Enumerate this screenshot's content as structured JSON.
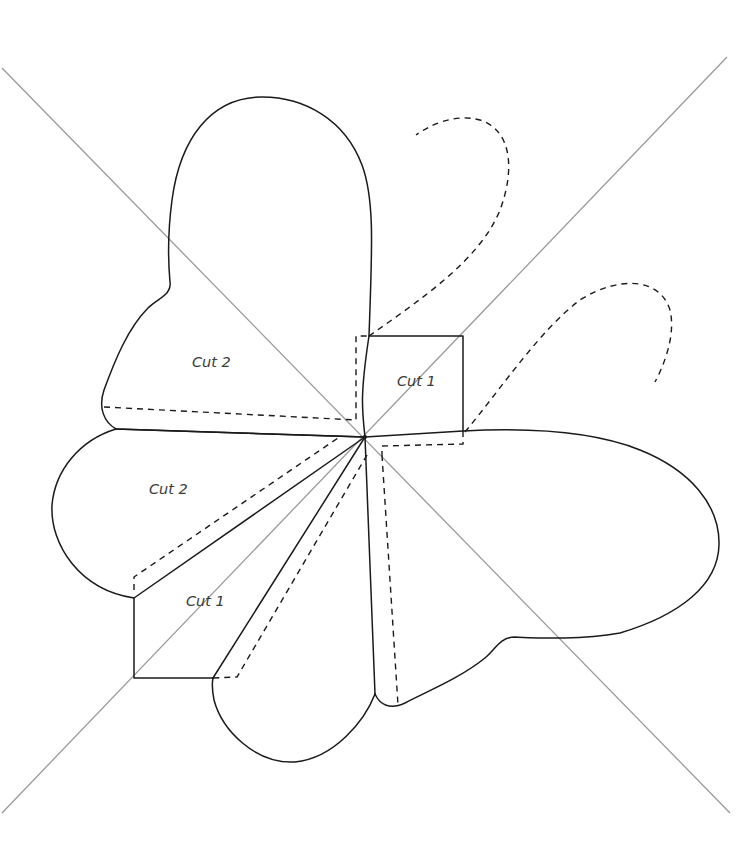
{
  "diagram": {
    "type": "sewing-pattern",
    "background": "#ffffff",
    "colors": {
      "cut_line": "#1a1a1a",
      "fold_line": "#1a1a1a",
      "guide_line": "#9a9a9a",
      "label_text": "#3a3a3a"
    },
    "center": [
      365,
      437
    ],
    "labels": [
      {
        "id": "top-left-flap",
        "text": "Cut 2",
        "x": 192,
        "y": 367
      },
      {
        "id": "top-square",
        "text": "Cut 1",
        "x": 397,
        "y": 386
      },
      {
        "id": "left-flap",
        "text": "Cut 2",
        "x": 149,
        "y": 494
      },
      {
        "id": "bottom-left-square",
        "text": "Cut 1",
        "x": 186,
        "y": 606
      }
    ],
    "legend": {
      "solid": "cut line",
      "dashed": "fold / stitch line",
      "grey": "alignment guide"
    }
  }
}
